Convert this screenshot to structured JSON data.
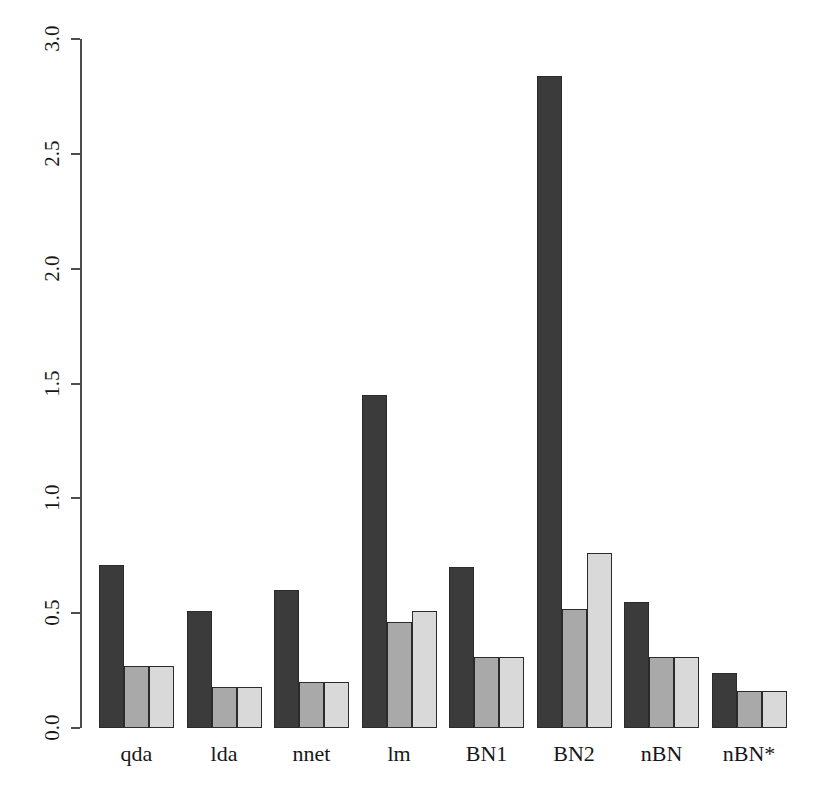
{
  "chart_data": {
    "type": "bar",
    "title": "",
    "subtitle": "",
    "xlabel": "",
    "ylabel": "",
    "grid": false,
    "legend_position": "none",
    "ylim": [
      0.0,
      3.0
    ],
    "y_ticks": [
      "0.0",
      "0.5",
      "1.0",
      "1.5",
      "2.0",
      "2.5",
      "3.0"
    ],
    "y_tick_values": [
      0.0,
      0.5,
      1.0,
      1.5,
      2.0,
      2.5,
      3.0
    ],
    "categories": [
      "qda",
      "lda",
      "nnet",
      "lm",
      "BN1",
      "BN2",
      "nBN",
      "nBN*"
    ],
    "series": [
      {
        "name": "series-1",
        "color": "#3b3b3b",
        "values": [
          0.71,
          0.51,
          0.6,
          1.45,
          0.7,
          2.84,
          0.55,
          0.24
        ]
      },
      {
        "name": "series-2",
        "color": "#a9a9a9",
        "values": [
          0.27,
          0.18,
          0.2,
          0.46,
          0.31,
          0.52,
          0.31,
          0.16
        ]
      },
      {
        "name": "series-3",
        "color": "#d9d9d9",
        "values": [
          0.27,
          0.18,
          0.2,
          0.51,
          0.31,
          0.76,
          0.31,
          0.16
        ]
      }
    ]
  },
  "axis": {
    "line_color": "#4d4d4d",
    "bar_border_color": "#2b2b2b"
  }
}
